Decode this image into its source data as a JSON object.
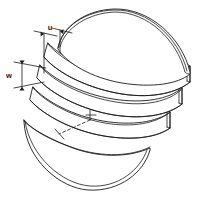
{
  "figure": {
    "type": "technical-line-drawing",
    "background_color": "#ffffff",
    "line_color": "#1a1a1a",
    "fill_color": "#ffffff",
    "width": 206,
    "height": 202
  },
  "annotations": {
    "dimension_u": {
      "label": "u",
      "kind": "horizontal-dimension",
      "description": "horizontal offset between stacked slices"
    },
    "dimension_w": {
      "label": "w",
      "kind": "vertical-dimension",
      "description": "vertical thickness of a slice layer"
    },
    "center_marker": {
      "label": "+",
      "kind": "center-crosshair",
      "description": "center point marker with dashed leader line"
    }
  },
  "parts": [
    {
      "name": "top-dome-cap",
      "label": ""
    },
    {
      "name": "upper-band",
      "label": ""
    },
    {
      "name": "middle-band",
      "label": ""
    },
    {
      "name": "lower-band",
      "label": ""
    },
    {
      "name": "bottom-bowl-cap",
      "label": ""
    }
  ]
}
